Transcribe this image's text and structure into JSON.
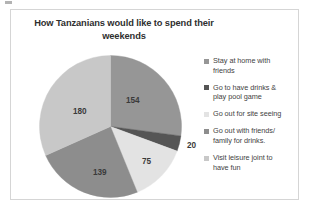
{
  "chart_data": {
    "type": "pie",
    "title": "How Tanzanians would like to spend their weekends",
    "title_line1": "How Tanzanians would like to spend their",
    "title_line2": "weekends",
    "categories": [
      "Stay at home with friends",
      "Go to have drinks & play pool game",
      "Go out for site seeing",
      "Go out with friends/ family for drinks.",
      "Visit leisure joint to have fun"
    ],
    "values": [
      154,
      20,
      75,
      139,
      180
    ],
    "total": 568,
    "colors": [
      "#969696",
      "#555555",
      "#e3e3e3",
      "#8d8d8d",
      "#c8c8c8"
    ],
    "data_labels": [
      "154",
      "20",
      "75",
      "139",
      "180"
    ],
    "legend_position": "right",
    "grid": false,
    "xlabel": "",
    "ylabel": ""
  },
  "legend": {
    "items": [
      {
        "label_line1": "Stay at home with",
        "label_line2": "friends",
        "color": "#969696"
      },
      {
        "label_line1": "Go to have drinks &",
        "label_line2": "play pool game",
        "color": "#555555"
      },
      {
        "label_line1": "Go out for site seeing",
        "label_line2": "",
        "color": "#e3e3e3"
      },
      {
        "label_line1": "Go out with friends/",
        "label_line2": "family for drinks.",
        "color": "#8d8d8d"
      },
      {
        "label_line1": "Visit leisure joint to",
        "label_line2": "have fun",
        "color": "#c8c8c8"
      }
    ]
  },
  "slice_labels": [
    {
      "text": "154",
      "left": "115px",
      "top": "86px"
    },
    {
      "text": "20",
      "left": "176px",
      "top": "131px"
    },
    {
      "text": "75",
      "left": "131px",
      "top": "147px"
    },
    {
      "text": "139",
      "left": "82px",
      "top": "158px"
    },
    {
      "text": "180",
      "left": "62px",
      "top": "97px"
    }
  ]
}
